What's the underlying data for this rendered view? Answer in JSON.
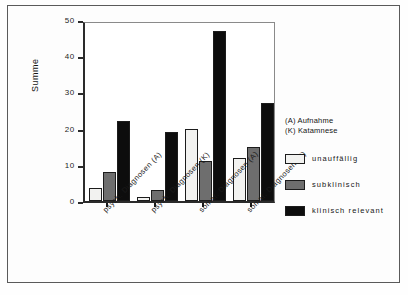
{
  "chart_data": {
    "type": "bar",
    "title": "",
    "xlabel": "",
    "ylabel": "Summe",
    "ylim": [
      0,
      50
    ],
    "ytick_step": 10,
    "yticks": [
      0,
      10,
      20,
      30,
      40,
      50
    ],
    "grid": false,
    "legend_position": "right",
    "categories": [
      "psych. Diagnosen (A)",
      "psych. Diagnosen (K)",
      "somat. Diagnosen (A)",
      "somat. Diagnosen (K)"
    ],
    "series": [
      {
        "name": "unauffällig",
        "color": "#f2f2f0",
        "values": [
          3.5,
          1,
          20,
          12
        ]
      },
      {
        "name": "subklinisch",
        "color": "#6e6e6e",
        "values": [
          8,
          3,
          11,
          15
        ]
      },
      {
        "name": "klinisch relevant",
        "color": "#0d0d0d",
        "values": [
          22,
          19,
          47,
          27
        ]
      }
    ],
    "annotations": [
      "(A) Aufnahme",
      "(K) Katamnese"
    ]
  },
  "legend": {
    "note_line_1": "(A) Aufnahme",
    "note_line_2": "(K) Katamnese",
    "items": [
      {
        "label": "unauffällig"
      },
      {
        "label": "subklinisch"
      },
      {
        "label": "klinisch relevant"
      }
    ]
  },
  "axis": {
    "y_title": "Summe",
    "y_labels": [
      "50",
      "40",
      "30",
      "20",
      "10",
      "0"
    ]
  }
}
